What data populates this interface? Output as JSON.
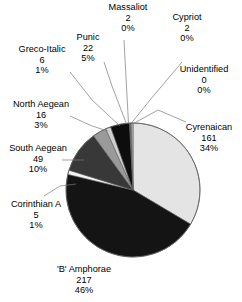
{
  "chart_data": {
    "type": "pie",
    "title": "",
    "subtitle": "",
    "xlabel": "",
    "ylabel": "",
    "legend_position": "none",
    "grid": false,
    "total": 472,
    "value_unit": "count",
    "labels_show": [
      "name",
      "value",
      "percent"
    ],
    "categories": [
      "Cyrenaican",
      "'B' Amphorae",
      "Corinthian A",
      "South Aegean",
      "North Aegean",
      "Greco-Italic",
      "Punic",
      "Massaliot",
      "Cypriot",
      "Unidentified"
    ],
    "values": [
      161,
      217,
      5,
      49,
      16,
      6,
      22,
      2,
      2,
      0
    ],
    "percents": [
      34,
      46,
      1,
      10,
      3,
      1,
      5,
      0,
      0,
      0
    ],
    "percent_labels": [
      "34%",
      "46%",
      "1%",
      "10%",
      "3%",
      "1%",
      "5%",
      "0%",
      "0%",
      "0%"
    ],
    "slice_colors": [
      "#e4e4e4",
      "#141414",
      "#f2f2f2",
      "#383838",
      "#9a9a9a",
      "#d0d0d0",
      "#0d0d0d",
      "#6e6e6e",
      "#bdbdbd",
      "#ffffff"
    ],
    "slices": [
      {
        "name": "Cyrenaican",
        "value": 161,
        "percent": "34%",
        "color": "#e4e4e4"
      },
      {
        "name": "'B' Amphorae",
        "value": 217,
        "percent": "46%",
        "color": "#141414"
      },
      {
        "name": "Corinthian A",
        "value": 5,
        "percent": "1%",
        "color": "#f2f2f2"
      },
      {
        "name": "South Aegean",
        "value": 49,
        "percent": "10%",
        "color": "#383838"
      },
      {
        "name": "North Aegean",
        "value": 16,
        "percent": "3%",
        "color": "#9a9a9a"
      },
      {
        "name": "Greco-Italic",
        "value": 6,
        "percent": "1%",
        "color": "#d0d0d0"
      },
      {
        "name": "Punic",
        "value": 22,
        "percent": "5%",
        "color": "#0d0d0d"
      },
      {
        "name": "Massaliot",
        "value": 2,
        "percent": "0%",
        "color": "#6e6e6e"
      },
      {
        "name": "Cypriot",
        "value": 2,
        "percent": "0%",
        "color": "#bdbdbd"
      },
      {
        "name": "Unidentified",
        "value": 0,
        "percent": "0%",
        "color": "#ffffff"
      }
    ]
  },
  "labels": {
    "massaliot": {
      "name": "Massaliot",
      "value": "2",
      "percent": "0%"
    },
    "cypriot": {
      "name": "Cypriot",
      "value": "2",
      "percent": "0%"
    },
    "punic": {
      "name": "Punic",
      "value": "22",
      "percent": "5%"
    },
    "greco_italic": {
      "name": "Greco-Italic",
      "value": "6",
      "percent": "1%"
    },
    "unidentified": {
      "name": "Unidentified",
      "value": "0",
      "percent": "0%"
    },
    "north_aegean": {
      "name": "North Aegean",
      "value": "16",
      "percent": "3%"
    },
    "cyrenaican": {
      "name": "Cyrenaican",
      "value": "161",
      "percent": "34%"
    },
    "south_aegean": {
      "name": "South Aegean",
      "value": "49",
      "percent": "10%"
    },
    "corinthian_a": {
      "name": "Corinthian A",
      "value": "5",
      "percent": "1%"
    },
    "b_amphorae": {
      "name": "'B' Amphorae",
      "value": "217",
      "percent": "46%"
    }
  },
  "style": {
    "background": "#ffffff",
    "text_color": "#000000",
    "outline_color": "#5a5a5a",
    "leader_color": "#7a7a7a"
  }
}
